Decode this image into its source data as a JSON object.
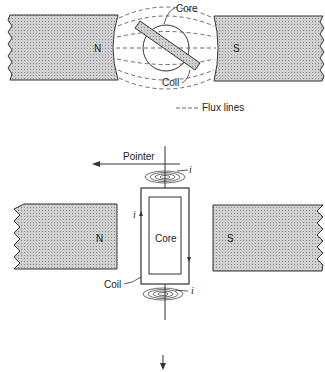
{
  "top_figure": {
    "north_label": "N",
    "south_label": "S",
    "core_label": "Core",
    "coil_label": "Coil",
    "legend_label": "Flux lines"
  },
  "bottom_figure": {
    "pointer_label": "Pointer",
    "current_label_top": "i",
    "current_label_left": "i",
    "current_label_bottom": "i",
    "north_label": "N",
    "south_label": "S",
    "core_label": "Core",
    "coil_label": "Coil"
  },
  "colors": {
    "pole_fill": "#bdbdbd",
    "line": "#333333",
    "coil_fill": "#9e9e9e"
  }
}
